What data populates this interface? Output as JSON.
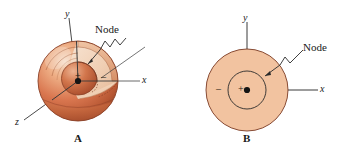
{
  "figure": {
    "panels": [
      {
        "id": "A",
        "caption": "A",
        "kind": "cutaway-sphere-3d",
        "node_label": "Node",
        "axes": [
          {
            "name": "y-axis",
            "label": "y"
          },
          {
            "name": "x-axis",
            "label": "x"
          },
          {
            "name": "z-axis",
            "label": "z"
          }
        ],
        "signs": {
          "inner": "+",
          "outer": "–"
        },
        "nucleus": "nucleus-dot"
      },
      {
        "id": "B",
        "caption": "B",
        "kind": "cross-section-2d",
        "node_label": "Node",
        "axes": [
          {
            "name": "y-axis",
            "label": "y"
          },
          {
            "name": "x-axis",
            "label": "x"
          }
        ],
        "signs": {
          "inner": "+",
          "outer": "–"
        },
        "nucleus": "nucleus-dot"
      }
    ]
  },
  "colors": {
    "sphere_light": "#f2cdb0",
    "sphere_mid": "#e0996f",
    "sphere_dark": "#b5583a",
    "sphere_deep": "#9c4228",
    "outline": "#8a4026",
    "circle_fill": "#f2c3a0",
    "circle_stroke": "#7a3a22",
    "axis": "#4a4a4a",
    "ink": "#1a1a1a",
    "background": "#ffffff"
  }
}
